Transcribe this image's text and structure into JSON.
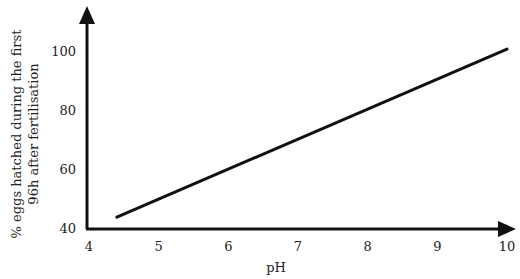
{
  "chart_data": {
    "type": "line",
    "title": "",
    "xlabel": "pH",
    "ylabel_lines": [
      "% eggs hatched during the first",
      "96h after fertilisation"
    ],
    "xlim": [
      4,
      10
    ],
    "ylim": [
      40,
      100
    ],
    "x_ticks": [
      4,
      5,
      6,
      7,
      8,
      9,
      10
    ],
    "y_ticks": [
      40,
      60,
      80,
      100
    ],
    "grid": false,
    "legend": "none",
    "series": [
      {
        "name": "hatch rate",
        "x": [
          4.4,
          10.0
        ],
        "y": [
          44,
          101
        ],
        "color": "#111111"
      }
    ]
  }
}
